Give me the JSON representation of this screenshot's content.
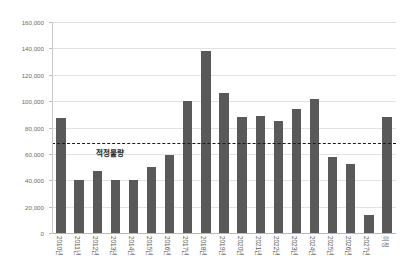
{
  "chart_data": {
    "type": "bar",
    "title": "",
    "subtitle": "",
    "xlabel": "",
    "ylabel": "",
    "ylim": [
      0,
      160000
    ],
    "ytick_interval": 20000,
    "ytick_labels": [
      "160,000",
      "140,000",
      "120,000",
      "100,000",
      "80,000",
      "60,000",
      "40,000",
      "20,000",
      "0"
    ],
    "ytick_values": [
      160000,
      140000,
      120000,
      100000,
      80000,
      60000,
      40000,
      20000,
      0
    ],
    "grid": true,
    "legend": false,
    "bar_color": "#595959",
    "categories": [
      "2010년",
      "2011년",
      "2012년",
      "2013년",
      "2014년",
      "2015년",
      "2016년",
      "2017년",
      "2018년",
      "2019년",
      "2020년",
      "2021년",
      "2022년",
      "2023년",
      "2024년",
      "2025년",
      "2026년",
      "2027년",
      "미정"
    ],
    "values": [
      87000,
      40000,
      47000,
      40000,
      40000,
      50000,
      59000,
      100000,
      138000,
      106000,
      88000,
      89000,
      85000,
      94000,
      102000,
      58000,
      52000,
      14000,
      88000
    ],
    "annotations": [
      {
        "name": "target-line",
        "label": "적정물량",
        "value": 68000,
        "style": "dashed",
        "color": "#1c1c1c"
      }
    ]
  }
}
